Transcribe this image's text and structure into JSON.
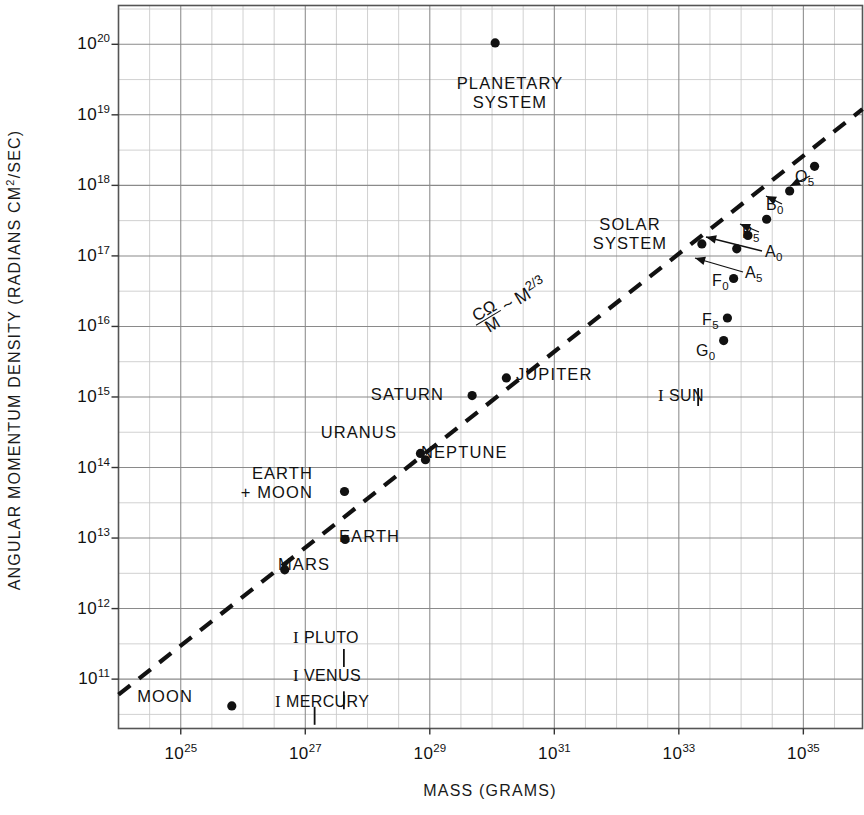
{
  "chart_data": {
    "type": "scatter",
    "title": "",
    "xlabel": "MASS (GRAMS)",
    "ylabel": "ANGULAR MOMENTUM DENSITY (RADIANS CM²/SEC)",
    "x_scale": "log10",
    "y_scale": "log10",
    "xlim": [
      24.0,
      35.95
    ],
    "ylim": [
      10.3,
      20.55
    ],
    "grid": true,
    "grid_minor_step": 0.5,
    "legend": "none",
    "xticks": [
      {
        "value": 25,
        "label": "10",
        "exponent": "25"
      },
      {
        "value": 27,
        "label": "10",
        "exponent": "27"
      },
      {
        "value": 29,
        "label": "10",
        "exponent": "29"
      },
      {
        "value": 31,
        "label": "10",
        "exponent": "31"
      },
      {
        "value": 33,
        "label": "10",
        "exponent": "33"
      },
      {
        "value": 35,
        "label": "10",
        "exponent": "35"
      }
    ],
    "yticks": [
      {
        "value": 20,
        "label": "10",
        "exponent": "20"
      },
      {
        "value": 19,
        "label": "10",
        "exponent": "19"
      },
      {
        "value": 18,
        "label": "10",
        "exponent": "18"
      },
      {
        "value": 17,
        "label": "10",
        "exponent": "17"
      },
      {
        "value": 16,
        "label": "10",
        "exponent": "16"
      },
      {
        "value": 15,
        "label": "10",
        "exponent": "15"
      },
      {
        "value": 14,
        "label": "10",
        "exponent": "14"
      },
      {
        "value": 13,
        "label": "10",
        "exponent": "13"
      },
      {
        "value": 12,
        "label": "10",
        "exponent": "12"
      },
      {
        "value": 11,
        "label": "10",
        "exponent": "11"
      }
    ],
    "trend_line": {
      "style": "dashed",
      "annotation": "CΩ/M ~ M^2/3",
      "annotation_parts": {
        "numerator": "CΩ",
        "denominator": "M",
        "relation": "~",
        "variable": "M",
        "exponent": "2/3"
      },
      "x_start": 24.0,
      "y_start": 10.78,
      "x_end": 35.95,
      "y_end": 19.08
    },
    "points": [
      {
        "name": "PLANETARY SYSTEM",
        "x": 30.05,
        "y": 20.02,
        "label": "PLANETARY\nSYSTEM",
        "marker": "dot"
      },
      {
        "name": "O5",
        "x": 35.18,
        "y": 18.27,
        "label": "O",
        "sub": "5",
        "marker": "dot+arrow"
      },
      {
        "name": "B0",
        "x": 34.78,
        "y": 17.92,
        "label": "B",
        "sub": "0",
        "marker": "dot+arrow"
      },
      {
        "name": "B5",
        "x": 34.41,
        "y": 17.52,
        "label": "B",
        "sub": "5",
        "marker": "dot+arrow"
      },
      {
        "name": "A0",
        "x": 34.11,
        "y": 17.29,
        "label": "A",
        "sub": "0",
        "marker": "dot+arrow"
      },
      {
        "name": "A5",
        "x": 33.93,
        "y": 17.1,
        "label": "A",
        "sub": "5",
        "marker": "dot+arrow"
      },
      {
        "name": "F0",
        "x": 33.88,
        "y": 16.68,
        "label": "F",
        "sub": "0",
        "marker": "dot"
      },
      {
        "name": "F5",
        "x": 33.78,
        "y": 16.12,
        "label": "F",
        "sub": "5",
        "marker": "dot"
      },
      {
        "name": "G0",
        "x": 33.72,
        "y": 15.8,
        "label": "G",
        "sub": "0",
        "marker": "dot"
      },
      {
        "name": "SOLAR SYSTEM",
        "x": 33.37,
        "y": 17.17,
        "label": "SOLAR\nSYSTEM",
        "marker": "dot"
      },
      {
        "name": "SUN",
        "x": 33.31,
        "y": 15.0,
        "label": "SUN",
        "marker": "bar"
      },
      {
        "name": "JUPITER",
        "x": 30.23,
        "y": 15.27,
        "label": "JUPITER",
        "marker": "dot"
      },
      {
        "name": "SATURN",
        "x": 29.68,
        "y": 15.02,
        "label": "SATURN",
        "marker": "dot"
      },
      {
        "name": "NEPTUNE",
        "x": 28.93,
        "y": 14.11,
        "label": "NEPTUNE",
        "marker": "dot"
      },
      {
        "name": "URANUS",
        "x": 28.85,
        "y": 14.2,
        "label": "URANUS",
        "marker": "dot"
      },
      {
        "name": "EARTH + MOON",
        "x": 27.63,
        "y": 13.66,
        "label": "EARTH\n+ MOON",
        "marker": "dot"
      },
      {
        "name": "EARTH",
        "x": 27.64,
        "y": 12.98,
        "label": "EARTH",
        "marker": "dot"
      },
      {
        "name": "MARS",
        "x": 26.67,
        "y": 12.55,
        "label": "MARS",
        "marker": "dot"
      },
      {
        "name": "PLUTO",
        "x": 27.62,
        "y": 11.3,
        "label": "PLUTO",
        "marker": "bar"
      },
      {
        "name": "VENUS",
        "x": 27.62,
        "y": 10.7,
        "label": "VENUS",
        "marker": "bar"
      },
      {
        "name": "MERCURY",
        "x": 27.15,
        "y": 10.48,
        "label": "MERCURY",
        "marker": "bar"
      },
      {
        "name": "MOON",
        "x": 25.82,
        "y": 10.62,
        "label": "MOON",
        "marker": "dot"
      }
    ]
  },
  "labels": {
    "planetary_system_l1": "PLANETARY",
    "planetary_system_l2": "SYSTEM",
    "solar_system_l1": "SOLAR",
    "solar_system_l2": "SYSTEM",
    "earth_moon_l1": "EARTH",
    "earth_moon_l2": "+ MOON",
    "jupiter": "JUPITER",
    "saturn": "SATURN",
    "neptune": "NEPTUNE",
    "uranus": "URANUS",
    "earth": "EARTH",
    "mars": "MARS",
    "moon": "MOON",
    "pluto": "PLUTO",
    "venus": "VENUS",
    "mercury": "MERCURY",
    "sun": "SUN",
    "limit_marker": "I",
    "o5": "O",
    "o5_sub": "5",
    "b0": "B",
    "b0_sub": "0",
    "b5": "B",
    "b5_sub": "5",
    "a0": "A",
    "a0_sub": "0",
    "a5": "A",
    "a5_sub": "5",
    "f0": "F",
    "f0_sub": "0",
    "f5": "F",
    "f5_sub": "5",
    "g0": "G",
    "g0_sub": "0"
  },
  "equation": {
    "numerator": "CΩ",
    "denominator": "M",
    "relation": "~",
    "variable": "M",
    "exponent": "2/3"
  },
  "axes": {
    "x_title": "MASS (GRAMS)",
    "y_title_pre": "ANGULAR MOMENTUM DENSITY (RADIANS CM",
    "y_title_sup": "2",
    "y_title_post": "/SEC)",
    "base": "10",
    "x_exps": [
      "25",
      "27",
      "29",
      "31",
      "33",
      "35"
    ],
    "y_exps": [
      "20",
      "19",
      "18",
      "17",
      "16",
      "15",
      "14",
      "13",
      "12",
      "11"
    ]
  },
  "colors": {
    "ink": "#111111",
    "grid_major": "#8a8a8a",
    "grid_minor": "#c9c9c9",
    "background": "#ffffff"
  }
}
